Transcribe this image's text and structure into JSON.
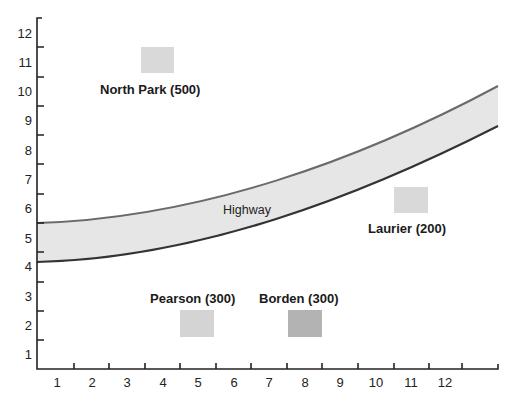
{
  "diagram": {
    "type": "grid-map",
    "x_axis": {
      "ticks": [
        "1",
        "2",
        "3",
        "4",
        "5",
        "6",
        "7",
        "8",
        "9",
        "10",
        "11",
        "12"
      ]
    },
    "y_axis": {
      "ticks": [
        "12",
        "11",
        "10",
        "9",
        "8",
        "7",
        "6",
        "5",
        "4",
        "3",
        "2",
        "1"
      ]
    },
    "road": {
      "label": "Highway",
      "fill": "#e6e6e6",
      "edge_top": "#6a6a6a",
      "edge_bottom": "#3a3a3a"
    },
    "towns": [
      {
        "name": "North Park (500)",
        "x": 4,
        "y": 11,
        "color": "#d9d9d9"
      },
      {
        "name": "Laurier (200)",
        "x": 11,
        "y": 6,
        "color": "#d9d9d9"
      },
      {
        "name": "Pearson (300)",
        "x": 5,
        "y": 2,
        "color": "#d4d4d4"
      },
      {
        "name": "Borden (300)",
        "x": 8,
        "y": 2,
        "color": "#b3b3b3"
      }
    ]
  }
}
